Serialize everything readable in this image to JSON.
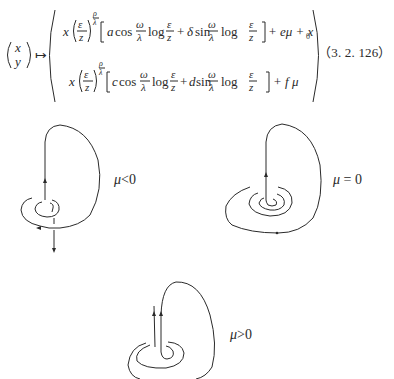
{
  "equation": {
    "lhs": {
      "top": "x",
      "bottom": "y"
    },
    "maps_to": "↦",
    "row1": {
      "prefix_var": "x",
      "frac_num": "ε",
      "frac_den": "z",
      "exp_num": "ρ",
      "exp_den": "λ",
      "coef1": "a",
      "func1": "cos",
      "omega": "ω",
      "lambda": "λ",
      "log": "log",
      "plus1": "+",
      "coef2": "δ",
      "func2": "sin",
      "tail": "+ eμ + x",
      "tail_sub": "0"
    },
    "row2": {
      "prefix_var": "x",
      "frac_num": "ε",
      "frac_den": "z",
      "exp_num": "ρ",
      "exp_den": "λ",
      "coef1": "c",
      "func1": "cos",
      "omega": "ω",
      "lambda": "λ",
      "log": "log",
      "plus1": "+",
      "coef2": "d",
      "func2": "sin",
      "tail": "+ f μ"
    },
    "number": "（3. 2. 126）"
  },
  "figures": [
    {
      "id": "mu-negative",
      "label_mu": "μ",
      "label_rel": "<0"
    },
    {
      "id": "mu-zero",
      "label_mu": "μ",
      "label_rel": " = 0"
    },
    {
      "id": "mu-positive",
      "label_mu": "μ",
      "label_rel": ">0"
    }
  ]
}
